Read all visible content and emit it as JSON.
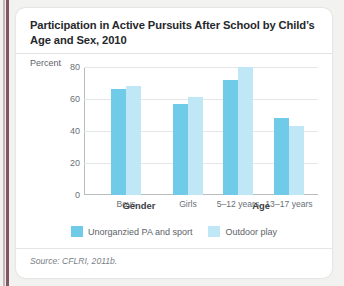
{
  "figure": {
    "title": "Participation in Active Pursuits After School by Child’s Age and Sex, 2010",
    "source": "Source: CFLRI, 2011b."
  },
  "colors": {
    "series_1": "#6fcbe8",
    "series_2": "#bfe7f5",
    "card_background": "#ffffff",
    "page_background": "#f2f2f1",
    "spine_rule": "#6d3b47",
    "axis": "#b9bcbe",
    "gridline": "#e4e6e7",
    "title_text": "#25282b",
    "tick_text": "#6a7075"
  },
  "chart_data": {
    "type": "bar",
    "title": "Participation in Active Pursuits After School by Child’s Age and Sex, 2010",
    "xlabel": "",
    "ylabel": "Percent",
    "ylim": [
      0,
      80
    ],
    "yticks": [
      0,
      20,
      40,
      60,
      80
    ],
    "ytick_labels": [
      "0",
      "20",
      "40",
      "60",
      "80"
    ],
    "grid": true,
    "legend_position": "bottom-center",
    "categories": [
      "Boys",
      "Girls",
      "5–12 years",
      "13–17 years"
    ],
    "category_groups": [
      {
        "label": "Gender",
        "categories": [
          "Boys",
          "Girls"
        ]
      },
      {
        "label": "Age",
        "categories": [
          "5–12 years",
          "13–17 years"
        ]
      }
    ],
    "series": [
      {
        "name": "Unorganzied PA and sport",
        "color": "#6fcbe8",
        "values": [
          66,
          57,
          72,
          48
        ]
      },
      {
        "name": "Outdoor play",
        "color": "#bfe7f5",
        "values": [
          68,
          61,
          80,
          43
        ]
      }
    ]
  },
  "axis": {
    "y_title": "Percent",
    "group_labels": [
      "Gender",
      "Age"
    ]
  }
}
